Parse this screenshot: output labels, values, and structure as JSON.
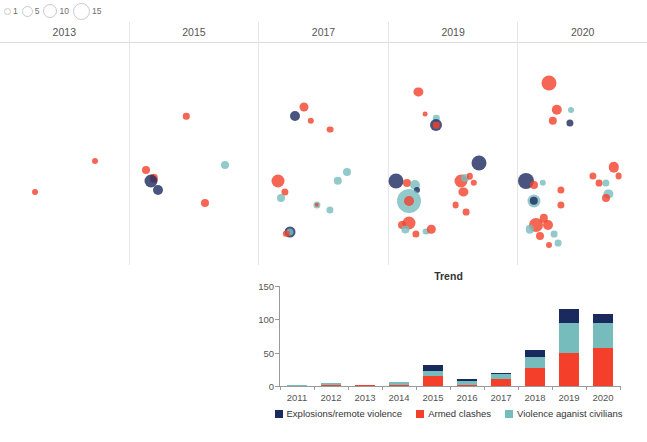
{
  "size_legend": {
    "name": "event-count-size-legend",
    "items": [
      {
        "label": "1",
        "size": 5
      },
      {
        "label": "5",
        "size": 9
      },
      {
        "label": "10",
        "size": 12
      },
      {
        "label": "15",
        "size": 15
      }
    ]
  },
  "colors": {
    "explosions": "#1b2a5e",
    "armed_clashes": "#f4402a",
    "violence_civilians": "#77bcbd",
    "map_outline": "#8a8a8a",
    "axis": "#9a9a9a",
    "panel_divider": "#e6e6e6"
  },
  "maps": {
    "region": "Chad",
    "panels": [
      {
        "title": "2013"
      },
      {
        "title": "2015"
      },
      {
        "title": "2017"
      },
      {
        "title": "2019"
      },
      {
        "title": "2020"
      }
    ],
    "events": {
      "2013": [
        {
          "x": 0.74,
          "y": 0.53,
          "r": 3.0,
          "type": "armed_clashes"
        },
        {
          "x": 0.27,
          "y": 0.67,
          "r": 3.0,
          "type": "armed_clashes"
        }
      ],
      "2015": [
        {
          "x": 0.44,
          "y": 0.33,
          "r": 3.2,
          "type": "armed_clashes"
        },
        {
          "x": 0.13,
          "y": 0.57,
          "r": 4.0,
          "type": "armed_clashes"
        },
        {
          "x": 0.19,
          "y": 0.61,
          "r": 4.2,
          "type": "armed_clashes"
        },
        {
          "x": 0.17,
          "y": 0.62,
          "r": 6.5,
          "type": "explosions"
        },
        {
          "x": 0.22,
          "y": 0.66,
          "r": 5.0,
          "type": "explosions"
        },
        {
          "x": 0.74,
          "y": 0.55,
          "r": 4.0,
          "type": "violence_civilians"
        },
        {
          "x": 0.59,
          "y": 0.72,
          "r": 4.0,
          "type": "armed_clashes"
        }
      ],
      "2017": [
        {
          "x": 0.35,
          "y": 0.29,
          "r": 4.5,
          "type": "armed_clashes"
        },
        {
          "x": 0.28,
          "y": 0.33,
          "r": 5.0,
          "type": "explosions"
        },
        {
          "x": 0.4,
          "y": 0.35,
          "r": 3.2,
          "type": "armed_clashes"
        },
        {
          "x": 0.55,
          "y": 0.39,
          "r": 3.4,
          "type": "armed_clashes"
        },
        {
          "x": 0.15,
          "y": 0.62,
          "r": 6.5,
          "type": "armed_clashes"
        },
        {
          "x": 0.2,
          "y": 0.67,
          "r": 3.6,
          "type": "armed_clashes"
        },
        {
          "x": 0.17,
          "y": 0.7,
          "r": 4.0,
          "type": "violence_civilians"
        },
        {
          "x": 0.68,
          "y": 0.58,
          "r": 4.0,
          "type": "violence_civilians"
        },
        {
          "x": 0.61,
          "y": 0.62,
          "r": 4.2,
          "type": "violence_civilians"
        },
        {
          "x": 0.45,
          "y": 0.73,
          "r": 3.6,
          "type": "violence_civilians"
        },
        {
          "x": 0.45,
          "y": 0.73,
          "r": 2.2,
          "type": "armed_clashes"
        },
        {
          "x": 0.55,
          "y": 0.75,
          "r": 3.6,
          "type": "violence_civilians"
        },
        {
          "x": 0.24,
          "y": 0.85,
          "r": 5.5,
          "type": "explosions"
        },
        {
          "x": 0.24,
          "y": 0.85,
          "r": 3.6,
          "type": "violence_civilians"
        },
        {
          "x": 0.21,
          "y": 0.86,
          "r": 3.2,
          "type": "armed_clashes"
        }
      ],
      "2019": [
        {
          "x": 0.23,
          "y": 0.22,
          "r": 4.6,
          "type": "armed_clashes"
        },
        {
          "x": 0.28,
          "y": 0.32,
          "r": 2.4,
          "type": "armed_clashes"
        },
        {
          "x": 0.37,
          "y": 0.34,
          "r": 3.2,
          "type": "violence_civilians"
        },
        {
          "x": 0.37,
          "y": 0.37,
          "r": 6.0,
          "type": "explosions"
        },
        {
          "x": 0.37,
          "y": 0.37,
          "r": 3.2,
          "type": "armed_clashes"
        },
        {
          "x": 0.7,
          "y": 0.54,
          "r": 7.5,
          "type": "explosions"
        },
        {
          "x": 0.06,
          "y": 0.62,
          "r": 7.5,
          "type": "explosions"
        },
        {
          "x": 0.14,
          "y": 0.63,
          "r": 4.0,
          "type": "armed_clashes"
        },
        {
          "x": 0.2,
          "y": 0.64,
          "r": 5.0,
          "type": "violence_civilians"
        },
        {
          "x": 0.22,
          "y": 0.66,
          "r": 3.0,
          "type": "explosions"
        },
        {
          "x": 0.16,
          "y": 0.71,
          "r": 12.0,
          "type": "violence_civilians"
        },
        {
          "x": 0.16,
          "y": 0.71,
          "r": 5.0,
          "type": "armed_clashes"
        },
        {
          "x": 0.56,
          "y": 0.62,
          "r": 6.5,
          "type": "armed_clashes"
        },
        {
          "x": 0.59,
          "y": 0.61,
          "r": 4.0,
          "type": "violence_civilians"
        },
        {
          "x": 0.63,
          "y": 0.6,
          "r": 3.2,
          "type": "armed_clashes"
        },
        {
          "x": 0.66,
          "y": 0.63,
          "r": 3.2,
          "type": "armed_clashes"
        },
        {
          "x": 0.58,
          "y": 0.67,
          "r": 4.6,
          "type": "armed_clashes"
        },
        {
          "x": 0.52,
          "y": 0.73,
          "r": 3.4,
          "type": "armed_clashes"
        },
        {
          "x": 0.6,
          "y": 0.76,
          "r": 3.4,
          "type": "armed_clashes"
        },
        {
          "x": 0.1,
          "y": 0.82,
          "r": 4.0,
          "type": "armed_clashes"
        },
        {
          "x": 0.16,
          "y": 0.81,
          "r": 6.5,
          "type": "armed_clashes"
        },
        {
          "x": 0.13,
          "y": 0.84,
          "r": 3.6,
          "type": "violence_civilians"
        },
        {
          "x": 0.21,
          "y": 0.86,
          "r": 3.6,
          "type": "armed_clashes"
        },
        {
          "x": 0.29,
          "y": 0.85,
          "r": 3.4,
          "type": "violence_civilians"
        },
        {
          "x": 0.33,
          "y": 0.84,
          "r": 4.2,
          "type": "armed_clashes"
        }
      ],
      "2020": [
        {
          "x": 0.24,
          "y": 0.18,
          "r": 7.5,
          "type": "armed_clashes"
        },
        {
          "x": 0.3,
          "y": 0.3,
          "r": 5.2,
          "type": "armed_clashes"
        },
        {
          "x": 0.27,
          "y": 0.35,
          "r": 4.2,
          "type": "armed_clashes"
        },
        {
          "x": 0.41,
          "y": 0.3,
          "r": 3.0,
          "type": "violence_civilians"
        },
        {
          "x": 0.4,
          "y": 0.36,
          "r": 3.6,
          "type": "explosions"
        },
        {
          "x": 0.06,
          "y": 0.62,
          "r": 8.0,
          "type": "explosions"
        },
        {
          "x": 0.12,
          "y": 0.64,
          "r": 4.0,
          "type": "armed_clashes"
        },
        {
          "x": 0.19,
          "y": 0.63,
          "r": 3.2,
          "type": "violence_civilians"
        },
        {
          "x": 0.12,
          "y": 0.71,
          "r": 6.5,
          "type": "violence_civilians"
        },
        {
          "x": 0.12,
          "y": 0.71,
          "r": 4.2,
          "type": "explosions"
        },
        {
          "x": 0.33,
          "y": 0.66,
          "r": 3.6,
          "type": "armed_clashes"
        },
        {
          "x": 0.33,
          "y": 0.73,
          "r": 3.6,
          "type": "armed_clashes"
        },
        {
          "x": 0.74,
          "y": 0.56,
          "r": 5.2,
          "type": "armed_clashes"
        },
        {
          "x": 0.78,
          "y": 0.6,
          "r": 3.4,
          "type": "armed_clashes"
        },
        {
          "x": 0.58,
          "y": 0.6,
          "r": 3.6,
          "type": "armed_clashes"
        },
        {
          "x": 0.63,
          "y": 0.63,
          "r": 3.4,
          "type": "armed_clashes"
        },
        {
          "x": 0.68,
          "y": 0.63,
          "r": 3.6,
          "type": "violence_civilians"
        },
        {
          "x": 0.7,
          "y": 0.68,
          "r": 4.6,
          "type": "violence_civilians"
        },
        {
          "x": 0.68,
          "y": 0.7,
          "r": 4.0,
          "type": "armed_clashes"
        },
        {
          "x": 0.14,
          "y": 0.82,
          "r": 7.0,
          "type": "armed_clashes"
        },
        {
          "x": 0.09,
          "y": 0.84,
          "r": 4.2,
          "type": "violence_civilians"
        },
        {
          "x": 0.2,
          "y": 0.79,
          "r": 4.2,
          "type": "armed_clashes"
        },
        {
          "x": 0.23,
          "y": 0.82,
          "r": 5.0,
          "type": "armed_clashes"
        },
        {
          "x": 0.17,
          "y": 0.87,
          "r": 4.0,
          "type": "armed_clashes"
        },
        {
          "x": 0.28,
          "y": 0.86,
          "r": 3.4,
          "type": "violence_civilians"
        },
        {
          "x": 0.31,
          "y": 0.9,
          "r": 3.4,
          "type": "violence_civilians"
        },
        {
          "x": 0.24,
          "y": 0.91,
          "r": 3.0,
          "type": "armed_clashes"
        }
      ]
    }
  },
  "chart_data": {
    "type": "bar",
    "stacked": true,
    "title": "Trend",
    "xlabel": "",
    "ylabel": "",
    "ylim": [
      0,
      150
    ],
    "yticks": [
      0,
      50,
      100,
      150
    ],
    "grid": false,
    "legend_position": "bottom",
    "categories": [
      "2011",
      "2012",
      "2013",
      "2014",
      "2015",
      "2016",
      "2017",
      "2018",
      "2019",
      "2020"
    ],
    "series": [
      {
        "name": "Armed clashes",
        "key": "armed_clashes",
        "color": "#f4402a",
        "values": [
          0,
          1,
          1,
          2,
          15,
          2,
          10,
          27,
          50,
          57
        ]
      },
      {
        "name": "Violence aganist civilians",
        "key": "violence_civilians",
        "color": "#77bcbd",
        "values": [
          2,
          4,
          0,
          4,
          8,
          6,
          8,
          16,
          45,
          38
        ]
      },
      {
        "name": "Explosions/remote violence",
        "key": "explosions",
        "color": "#1b2a5e",
        "values": [
          0,
          0,
          0,
          0,
          8,
          2,
          2,
          11,
          21,
          13
        ]
      }
    ],
    "legend_order": [
      "Explosions/remote violence",
      "Armed clashes",
      "Violence aganist civilians"
    ]
  }
}
